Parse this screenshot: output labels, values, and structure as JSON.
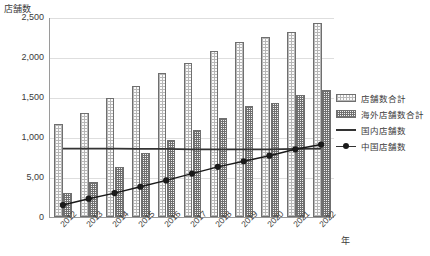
{
  "chart_data": {
    "type": "bar",
    "title": "店舗数",
    "xlabel": "年",
    "ylabel": "店舗数",
    "categories": [
      "2012",
      "2013",
      "2014",
      "2015",
      "2016",
      "2017",
      "2018",
      "2019",
      "2020",
      "2021",
      "2022"
    ],
    "ylim": [
      0,
      2500
    ],
    "ytick_labels": [
      "0",
      "5,00",
      "1,000",
      "1,500",
      "2,000",
      "2,500"
    ],
    "ytick_values": [
      0,
      500,
      1000,
      1500,
      2000,
      2500
    ],
    "grid": true,
    "legend_position": "right",
    "series": [
      {
        "name": "店舗数合計",
        "type": "bar",
        "values": [
          1160,
          1300,
          1490,
          1640,
          1800,
          1930,
          2070,
          2190,
          2250,
          2310,
          2420
        ]
      },
      {
        "name": "海外店舗数合計",
        "type": "bar",
        "values": [
          300,
          440,
          630,
          800,
          960,
          1090,
          1240,
          1390,
          1420,
          1520,
          1590
        ]
      },
      {
        "name": "国内店舗数",
        "type": "line",
        "values": [
          860,
          860,
          860,
          855,
          855,
          850,
          850,
          850,
          850,
          855,
          860
        ]
      },
      {
        "name": "中国店舗数",
        "type": "line-marker",
        "values": [
          150,
          230,
          300,
          380,
          460,
          545,
          630,
          700,
          770,
          850,
          910
        ]
      }
    ]
  },
  "legend": {
    "items": [
      {
        "label": "店舗数合計",
        "style": "total"
      },
      {
        "label": "海外店舗数合計",
        "style": "overseas"
      },
      {
        "label": "国内店舗数",
        "style": "lineonly"
      },
      {
        "label": "中国店舗数",
        "style": "linemark"
      }
    ]
  },
  "colors": {
    "axis": "#9a9a9a",
    "grid": "#dedede",
    "text": "#3a3a3a",
    "line_domestic": "#333333",
    "line_china": "#1a1a1a",
    "bar_total_edge": "#6f6f6f",
    "bar_overseas_edge": "#6f6f6f"
  }
}
